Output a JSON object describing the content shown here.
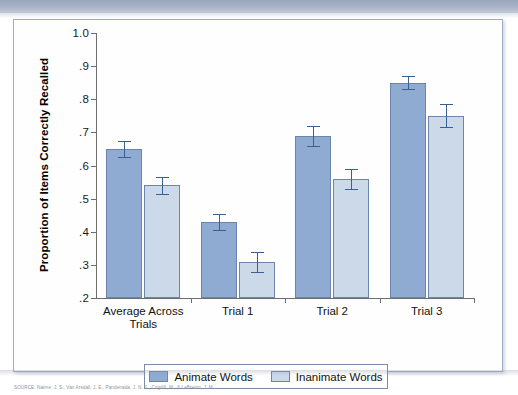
{
  "figure": {
    "source_caption": "SOURCE: Nairne, J. S., Van Arsdall, J. E., Pandeirada, J. N. S., Cogdill, M., & LeBreton, J. M."
  },
  "chart_data": {
    "type": "bar",
    "title": "",
    "xlabel": "",
    "ylabel": "Proportion of Items Correctly Recalled",
    "ylim": [
      0.2,
      1.0
    ],
    "ytick_labels": [
      "1.0",
      ".9",
      ".8",
      ".7",
      ".6",
      ".5",
      ".4",
      ".3",
      ".2"
    ],
    "ytick_values": [
      1.0,
      0.9,
      0.8,
      0.7,
      0.6,
      0.5,
      0.4,
      0.3,
      0.2
    ],
    "grid": false,
    "legend_position": "bottom",
    "categories": [
      "Average Across\nTrials",
      "Trial 1",
      "Trial 2",
      "Trial 3"
    ],
    "series": [
      {
        "name": "Animate Words",
        "color": "#8fabd2",
        "values": [
          0.65,
          0.43,
          0.69,
          0.85
        ],
        "errors": [
          0.025,
          0.025,
          0.03,
          0.02
        ]
      },
      {
        "name": "Inanimate Words",
        "color": "#ccd9e9",
        "values": [
          0.54,
          0.31,
          0.56,
          0.75
        ],
        "errors": [
          0.025,
          0.03,
          0.03,
          0.035
        ]
      }
    ]
  }
}
